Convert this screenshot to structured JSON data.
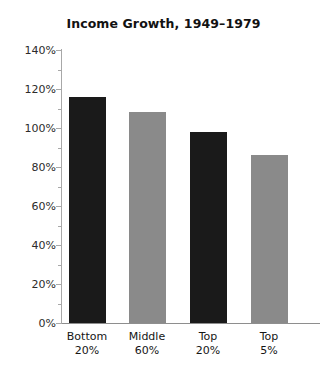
{
  "chart_data": {
    "type": "bar",
    "title": "Income Growth, 1949–1979",
    "xlabel": "",
    "ylabel": "",
    "categories": [
      "Bottom 20%",
      "Middle 60%",
      "Top 20%",
      "Top 5%"
    ],
    "category_lines": [
      {
        "line1": "Bottom",
        "line2": "20%"
      },
      {
        "line1": "Middle",
        "line2": "60%"
      },
      {
        "line1": "Top",
        "line2": "20%"
      },
      {
        "line1": "Top",
        "line2": "5%"
      }
    ],
    "values": [
      116,
      108,
      98,
      86
    ],
    "value_labels": [
      "116%",
      "108%",
      "98%",
      "86%"
    ],
    "ylim": [
      0,
      140
    ],
    "ytick_values": [
      0,
      20,
      40,
      60,
      80,
      100,
      120,
      140
    ],
    "ytick_labels": [
      "0%",
      "20%",
      "40%",
      "60%",
      "80%",
      "100%",
      "120%",
      "140%"
    ],
    "yminor_tick_values": [
      10,
      30,
      50,
      70,
      90,
      110,
      130
    ],
    "grid": false,
    "legend": null,
    "bar_colors": [
      "#1a1a1a",
      "#8a8a8a",
      "#1a1a1a",
      "#8a8a8a"
    ]
  },
  "colors": {
    "background": "#ffffff",
    "bar_dark": "#1a1a1a",
    "bar_light": "#8a8a8a",
    "axis": "#a8a8a8",
    "axis_bottom": "#8e8e8e",
    "title_text": "#121212",
    "tick_text": "#2b2b2b"
  }
}
